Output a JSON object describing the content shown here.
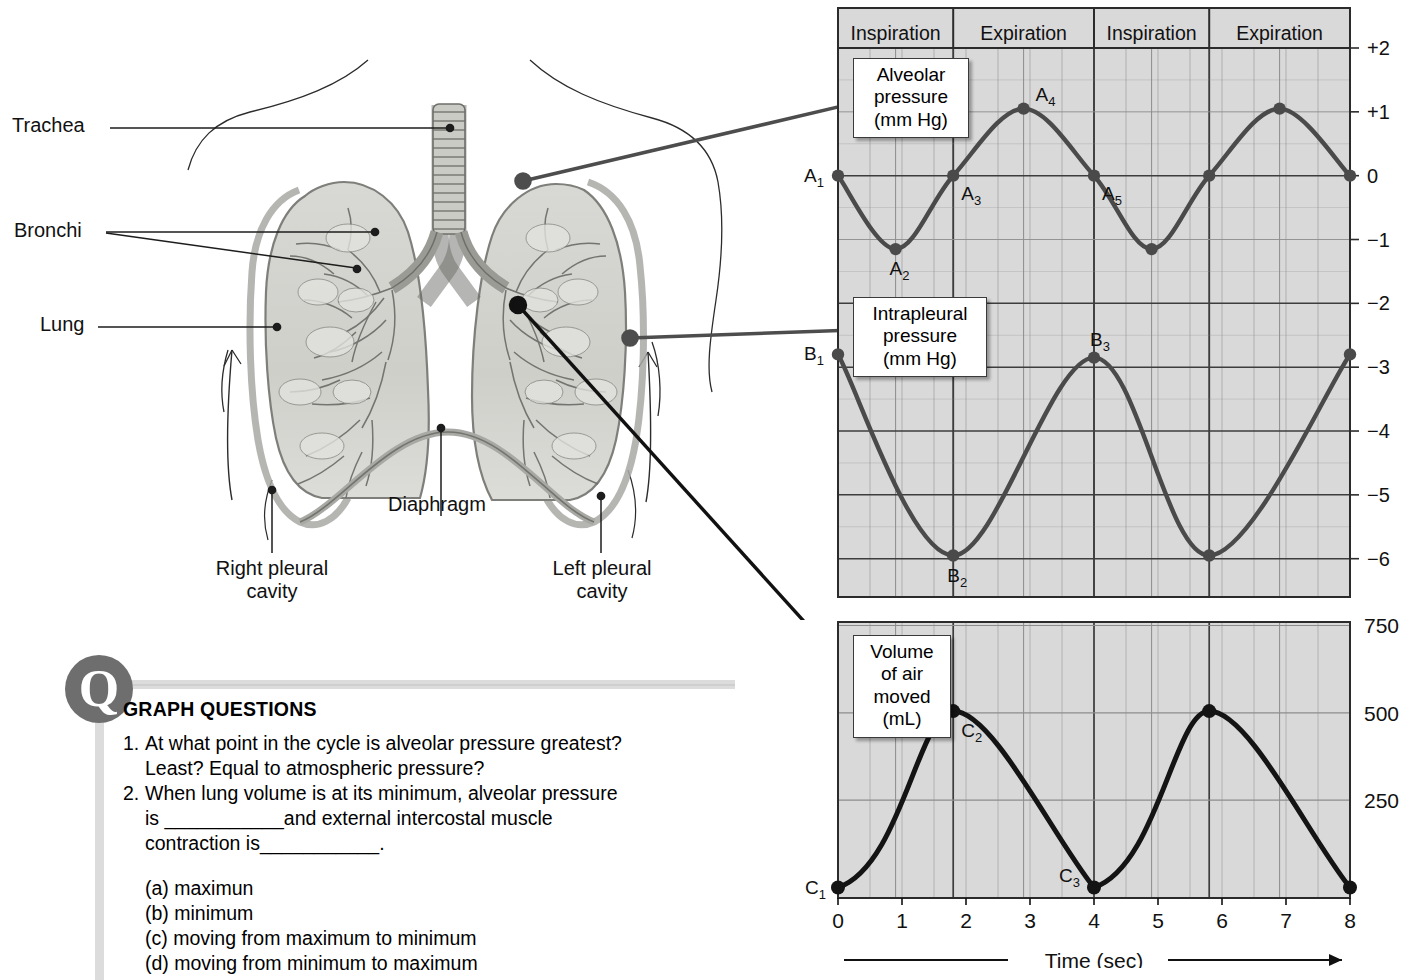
{
  "diagram": {
    "labels": [
      {
        "id": "trachea",
        "text": "Trachea"
      },
      {
        "id": "bronchi",
        "text": "Bronchi"
      },
      {
        "id": "lung",
        "text": "Lung"
      },
      {
        "id": "diaphragm",
        "text": "Diaphragm"
      },
      {
        "id": "right-pleural-cavity",
        "text": "Right pleural\ncavity"
      },
      {
        "id": "left-pleural-cavity",
        "text": "Left pleural\ncavity"
      }
    ]
  },
  "callouts": {
    "alveolar": "Alveolar\npressure\n(mm Hg)",
    "intrapleural": "Intrapleural\npressure\n(mm Hg)",
    "volume": "Volume\nof air\nmoved\n(mL)"
  },
  "questions": {
    "heading": "GRAPH QUESTIONS",
    "items": [
      {
        "num": "1.",
        "line1": "At what point in the cycle is alveolar pressure greatest?",
        "line2": "Least? Equal to atmospheric pressure?"
      },
      {
        "num": "2.",
        "line1": "When lung volume is at its minimum, alveolar pressure",
        "line2": "is ___________and external intercostal muscle",
        "line3": "contraction is___________."
      }
    ],
    "options": [
      "(a) maximun",
      "(b) minimum",
      "(c) moving from maximum to minimum",
      "(d) moving from minimum to maximum"
    ]
  },
  "chart_data": [
    {
      "type": "line",
      "name": "pressure-chart",
      "title": "",
      "xlabel": "Time (sec)",
      "ylabel": "mm Hg",
      "xlim": [
        0,
        8
      ],
      "ylim": [
        -6.6,
        2.0
      ],
      "grid": true,
      "xticks": [
        0,
        1,
        2,
        3,
        4,
        5,
        6,
        7,
        8
      ],
      "yticks": [
        2,
        1,
        0,
        -1,
        -2,
        -3,
        -4,
        -5,
        -6
      ],
      "ytick_labels": [
        "+2",
        "+1",
        "0",
        "−1",
        "−2",
        "−3",
        "−4",
        "−5",
        "−6"
      ],
      "phases": [
        {
          "label": "Inspiration",
          "start": 0,
          "end": 1.8
        },
        {
          "label": "Expiration",
          "start": 1.8,
          "end": 4.0
        },
        {
          "label": "Inspiration",
          "start": 4.0,
          "end": 5.8
        },
        {
          "label": "Expiration",
          "start": 5.8,
          "end": 8.0
        }
      ],
      "series": [
        {
          "name": "Alveolar pressure (mm Hg)",
          "points": [
            {
              "x": 0.0,
              "y": 0.0,
              "label": "A1",
              "marker": true
            },
            {
              "x": 0.9,
              "y": -1.15,
              "label": "A2",
              "marker": true
            },
            {
              "x": 1.8,
              "y": 0.0,
              "label": "A3",
              "marker": true
            },
            {
              "x": 2.9,
              "y": 1.05,
              "label": "A4",
              "marker": true
            },
            {
              "x": 4.0,
              "y": 0.0,
              "label": "A5",
              "marker": true
            },
            {
              "x": 4.9,
              "y": -1.15,
              "label": "",
              "marker": true
            },
            {
              "x": 5.8,
              "y": 0.0,
              "label": "",
              "marker": true
            },
            {
              "x": 6.9,
              "y": 1.05,
              "label": "",
              "marker": true
            },
            {
              "x": 8.0,
              "y": 0.0,
              "label": "",
              "marker": true
            }
          ]
        },
        {
          "name": "Intrapleural pressure (mm Hg)",
          "points": [
            {
              "x": 0.0,
              "y": -2.8,
              "label": "B1",
              "marker": true
            },
            {
              "x": 1.8,
              "y": -5.95,
              "label": "B2",
              "marker": true
            },
            {
              "x": 4.0,
              "y": -2.85,
              "label": "B3",
              "marker": true
            },
            {
              "x": 5.8,
              "y": -5.95,
              "label": "",
              "marker": true
            },
            {
              "x": 8.0,
              "y": -2.8,
              "label": "",
              "marker": true
            }
          ]
        }
      ]
    },
    {
      "type": "line",
      "name": "volume-chart",
      "title": "",
      "xlabel": "Time (sec)",
      "ylabel": "mL",
      "xlim": [
        0,
        8
      ],
      "ylim": [
        -30,
        760
      ],
      "grid": true,
      "xticks": [
        0,
        1,
        2,
        3,
        4,
        5,
        6,
        7,
        8
      ],
      "yticks": [
        750,
        500,
        250
      ],
      "ytick_labels": [
        "750",
        "500",
        "250"
      ],
      "series": [
        {
          "name": "Volume of air moved (mL)",
          "points": [
            {
              "x": 0.0,
              "y": 0,
              "label": "C1",
              "marker": true
            },
            {
              "x": 1.8,
              "y": 505,
              "label": "C2",
              "marker": true
            },
            {
              "x": 4.0,
              "y": 0,
              "label": "C3",
              "marker": true
            },
            {
              "x": 5.8,
              "y": 505,
              "label": "",
              "marker": true
            },
            {
              "x": 8.0,
              "y": 0,
              "label": "",
              "marker": true
            }
          ]
        }
      ]
    }
  ],
  "colors": {
    "plot_bg": "#d9d9d9",
    "grid_minor": "#8c8c8c",
    "grid_major": "#3d3d3d",
    "curve_pressure": "#4a4a4a",
    "curve_volume": "#141414",
    "q_badge": "#6e6e6e",
    "frame": "#2b2b2b"
  },
  "axis": {
    "time_label": "Time (sec)"
  }
}
